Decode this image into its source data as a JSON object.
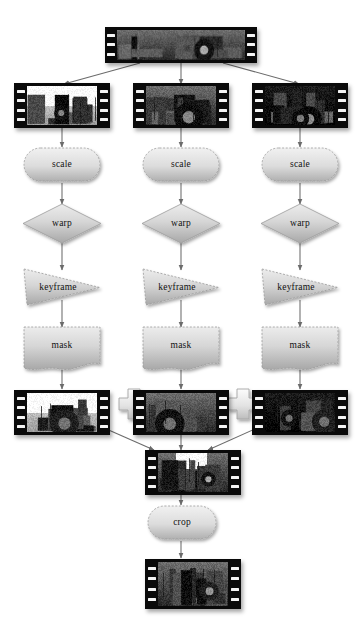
{
  "diagram": {
    "background_color": "#ffffff",
    "node_fill_light": "#e8e8e8",
    "node_fill_dark": "#a9a9a9",
    "film_border_color": "#0a0a0a",
    "arrow_color": "#6b6b6b",
    "columns": [
      {
        "id": "left",
        "label": "branch-1"
      },
      {
        "id": "center",
        "label": "branch-2"
      },
      {
        "id": "right",
        "label": "branch-3"
      }
    ],
    "source": {
      "type": "film-strip",
      "label": "source-clip",
      "scene": "panoramic tractor scene"
    },
    "branch_inputs": [
      {
        "label": "input-clip-left",
        "scene": "tractor wide shot"
      },
      {
        "label": "input-clip-center",
        "scene": "tractor mid shot"
      },
      {
        "label": "input-clip-right",
        "scene": "tractor wheel close-up"
      }
    ],
    "operations": [
      {
        "name": "scale",
        "shape": "stadium"
      },
      {
        "name": "warp",
        "shape": "diamond"
      },
      {
        "name": "keyframe",
        "shape": "triangle"
      },
      {
        "name": "mask",
        "shape": "wavy-rect"
      }
    ],
    "branch_outputs": [
      {
        "label": "masked-clip-left",
        "scene": "tractor wide masked"
      },
      {
        "label": "masked-clip-center",
        "scene": "tractor mid masked"
      },
      {
        "label": "masked-clip-right",
        "scene": "tractor wheel masked"
      }
    ],
    "combiners": [
      {
        "symbol": "+",
        "name": "composite-plus-1"
      },
      {
        "symbol": "+",
        "name": "composite-plus-2"
      }
    ],
    "composite": {
      "label": "composited-clip",
      "scene": "combined tractor scene"
    },
    "final_operation": {
      "name": "crop",
      "shape": "stadium"
    },
    "final_output": {
      "label": "final-clip",
      "scene": "cropped tractor scene"
    },
    "operation_labels": {
      "scale": "scale",
      "warp": "warp",
      "keyframe": "keyframe",
      "mask": "mask",
      "crop": "crop"
    }
  }
}
